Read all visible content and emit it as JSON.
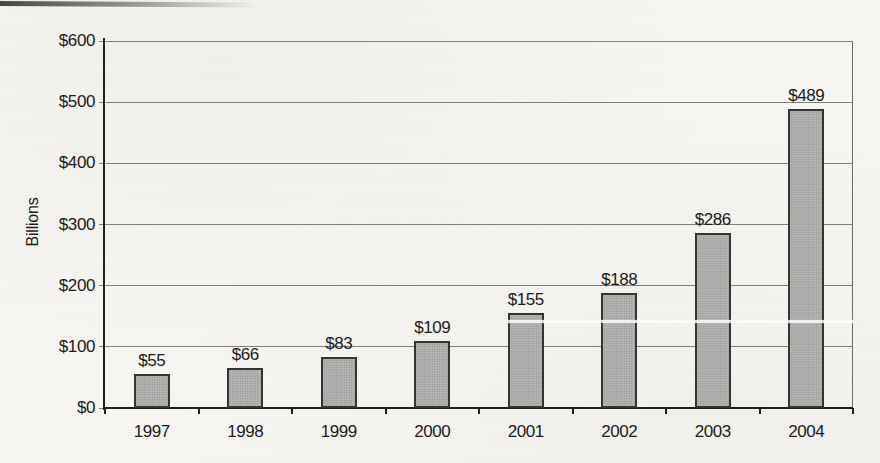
{
  "chart_data": {
    "type": "bar",
    "title": "",
    "categories": [
      "1997",
      "1998",
      "1999",
      "2000",
      "2001",
      "2002",
      "2003",
      "2004"
    ],
    "values": [
      55,
      66,
      83,
      109,
      155,
      188,
      286,
      489
    ],
    "value_labels": [
      "$55",
      "$66",
      "$83",
      "$109",
      "$155",
      "$188",
      "$286",
      "$489"
    ],
    "xlabel": "",
    "ylabel": "Billions",
    "ylim": [
      0,
      600
    ],
    "ytick_step": 100,
    "ytick_labels": [
      "$0",
      "$100",
      "$200",
      "$300",
      "$400",
      "$500",
      "$600"
    ],
    "grid": true,
    "legend_position": "none",
    "colors": {
      "background": "#f7f6f2",
      "bar_fill": "#b3b3b1",
      "bar_border": "#343432",
      "gridline": "#6b6b69",
      "axis": "#1f1f1d",
      "text": "#1c1c1a"
    }
  }
}
